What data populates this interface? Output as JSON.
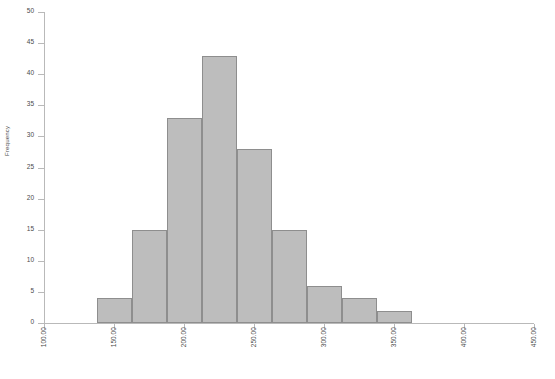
{
  "chart_data": {
    "type": "bar",
    "chart_subtype": "histogram",
    "title": "",
    "xlabel": "",
    "ylabel": "Frequency",
    "xlim": [
      100.0,
      450.0
    ],
    "ylim": [
      0,
      50
    ],
    "grid": false,
    "legend": null,
    "bin_width": 25,
    "bar_color": "#bdbdbd",
    "bar_edge_color": "#8e8e8e",
    "axis_color": "#b9b9b9",
    "x_tick_labels": [
      "100.00",
      "150.00",
      "200.00",
      "250.00",
      "300.00",
      "350.00",
      "400.00",
      "450.00"
    ],
    "x_tick_values": [
      100,
      150,
      200,
      250,
      300,
      350,
      400,
      450
    ],
    "y_tick_labels": [
      "0",
      "5",
      "10",
      "15",
      "20",
      "25",
      "30",
      "35",
      "40",
      "45",
      "50"
    ],
    "y_tick_values": [
      0,
      5,
      10,
      15,
      20,
      25,
      30,
      35,
      40,
      45,
      50
    ],
    "bins": [
      {
        "start": 137.5,
        "end": 162.5,
        "value": 4
      },
      {
        "start": 162.5,
        "end": 187.5,
        "value": 15
      },
      {
        "start": 187.5,
        "end": 212.5,
        "value": 33
      },
      {
        "start": 212.5,
        "end": 237.5,
        "value": 43
      },
      {
        "start": 237.5,
        "end": 262.5,
        "value": 28
      },
      {
        "start": 262.5,
        "end": 287.5,
        "value": 15
      },
      {
        "start": 287.5,
        "end": 312.5,
        "value": 6
      },
      {
        "start": 312.5,
        "end": 337.5,
        "value": 4
      },
      {
        "start": 337.5,
        "end": 362.5,
        "value": 2
      }
    ],
    "categories": [
      "137.5-162.5",
      "162.5-187.5",
      "187.5-212.5",
      "212.5-237.5",
      "237.5-262.5",
      "262.5-287.5",
      "287.5-312.5",
      "312.5-337.5",
      "337.5-362.5"
    ],
    "values": [
      4,
      15,
      33,
      43,
      28,
      15,
      6,
      4,
      2
    ]
  }
}
